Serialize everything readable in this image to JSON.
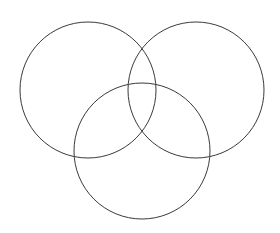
{
  "figure": {
    "title": "",
    "type": "venn-diagram",
    "set_count": 3,
    "background_color": "#ffffff",
    "canvas": {
      "width": 280,
      "height": 233
    }
  },
  "style": {
    "stroke_color": "#3a3a3a",
    "stroke_width": 1,
    "fill": "none"
  },
  "chart_data": {
    "type": "diagram",
    "subtype": "venn",
    "title": "",
    "xlabel": "",
    "ylabel": "",
    "grid": false,
    "legend": "none",
    "annotations": [],
    "labels": [],
    "region_values": [],
    "circles": [
      {
        "id": "set-a",
        "label": "",
        "position": "top-left",
        "cx": 88,
        "cy": 90,
        "r": 68,
        "stroke": "#3a3a3a"
      },
      {
        "id": "set-b",
        "label": "",
        "position": "top-right",
        "cx": 196,
        "cy": 90,
        "r": 68,
        "stroke": "#3a3a3a"
      },
      {
        "id": "set-c",
        "label": "",
        "position": "bottom-center",
        "cx": 142,
        "cy": 151,
        "r": 68,
        "stroke": "#3a3a3a"
      }
    ]
  }
}
